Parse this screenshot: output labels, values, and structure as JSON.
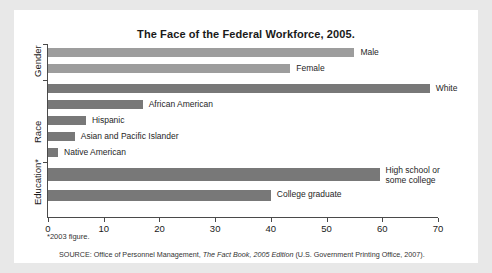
{
  "chart_data": {
    "type": "bar",
    "orientation": "horizontal",
    "title": "The Face of the Federal Workforce, 2005.",
    "xlabel": "",
    "ylabel": "",
    "xlim": [
      0,
      70
    ],
    "xticks": [
      0,
      10,
      20,
      30,
      40,
      50,
      60,
      70
    ],
    "grid": false,
    "legend": "none",
    "groups": [
      {
        "name": "Gender",
        "categories": [
          "Male",
          "Female"
        ],
        "values": [
          55,
          43.5
        ],
        "color": "#9d9d9d"
      },
      {
        "name": "Race",
        "categories": [
          "White",
          "African American",
          "Hispanic",
          "Asian and Pacific Islander",
          "Native American"
        ],
        "values": [
          68.5,
          17,
          6.8,
          4.8,
          1.8
        ],
        "color": "#787878"
      },
      {
        "name": "Education*",
        "categories": [
          "High school or some college",
          "College graduate"
        ],
        "values": [
          59.5,
          40
        ],
        "color": "#787878"
      }
    ],
    "categories": [
      "Male",
      "Female",
      "White",
      "African American",
      "Hispanic",
      "Asian and Pacific Islander",
      "Native American",
      "High school or some college",
      "College graduate"
    ],
    "values": [
      55,
      43.5,
      68.5,
      17,
      6.8,
      4.8,
      1.8,
      59.5,
      40
    ],
    "footnote": "*2003 figure.",
    "source": "SOURCE: Office of Personnel Management, The Fact Book, 2005 Edition (U.S. Government Printing Office, 2007)."
  },
  "bars": [
    {
      "label": "Male",
      "value": 55,
      "label_wrap": false
    },
    {
      "label": "Female",
      "value": 43.5,
      "label_wrap": false
    },
    {
      "label": "White",
      "value": 68.5,
      "label_wrap": false
    },
    {
      "label": "African American",
      "value": 17,
      "label_wrap": false
    },
    {
      "label": "Hispanic",
      "value": 6.8,
      "label_wrap": false
    },
    {
      "label": "Asian and Pacific Islander",
      "value": 4.8,
      "label_wrap": false
    },
    {
      "label": "Native American",
      "value": 1.8,
      "label_wrap": false
    },
    {
      "label": "High school or some college",
      "value": 59.5,
      "label_wrap": true
    },
    {
      "label": "College graduate",
      "value": 40,
      "label_wrap": false
    }
  ],
  "group_labels": [
    "Gender",
    "Race",
    "Education*"
  ],
  "xticks": [
    "0",
    "10",
    "20",
    "30",
    "40",
    "50",
    "60",
    "70"
  ],
  "notes": {
    "footnote": "*2003 figure.",
    "source_prefix": "SOURCE: Office of Personnel Management, ",
    "source_italic": "The Fact Book, 2005 Edition",
    "source_suffix": " (U.S. Government Printing Office, 2007)."
  },
  "colors": {
    "gender_bar": "#9d9d9d",
    "race_bar": "#787878",
    "education_bar": "#787878",
    "axis": "#4a4a4a",
    "card": "#ffffff",
    "page": "#e8e8e8"
  }
}
